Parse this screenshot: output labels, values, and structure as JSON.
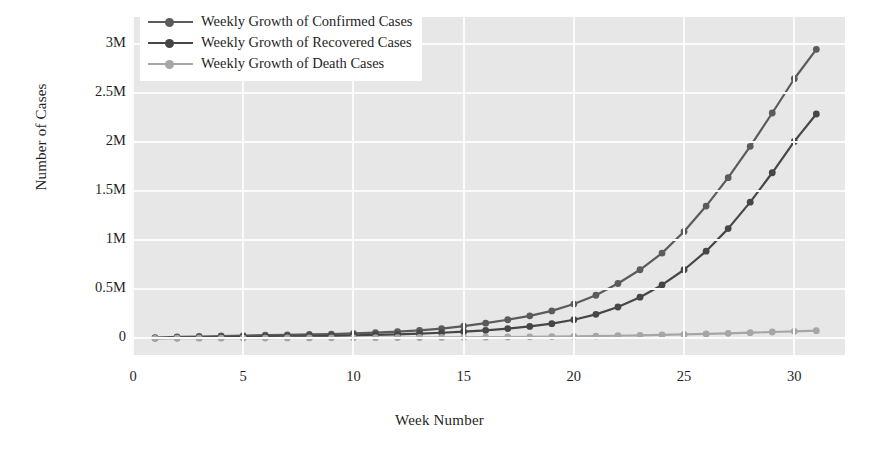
{
  "chart_data": {
    "type": "line",
    "title": "",
    "xlabel": "Week Number",
    "ylabel": "Number of Cases",
    "xlim": [
      0,
      32.3
    ],
    "ylim": [
      -170000,
      3280000
    ],
    "grid": true,
    "legend_position": "top-left",
    "x": [
      1,
      2,
      3,
      4,
      5,
      6,
      7,
      8,
      9,
      10,
      11,
      12,
      13,
      14,
      15,
      16,
      17,
      18,
      19,
      20,
      21,
      22,
      23,
      24,
      25,
      26,
      27,
      28,
      29,
      30,
      31
    ],
    "xticks": [
      0,
      5,
      10,
      15,
      20,
      25,
      30
    ],
    "xtick_labels": [
      "0",
      "5",
      "10",
      "15",
      "20",
      "25",
      "30"
    ],
    "yticks": [
      0,
      500000,
      1000000,
      1500000,
      2000000,
      2500000,
      3000000
    ],
    "ytick_labels": [
      "0",
      "0.5M",
      "1M",
      "1.5M",
      "2M",
      "2.5M",
      "3M"
    ],
    "series": [
      {
        "name": "Weekly Growth of Confirmed Cases",
        "color": "#5b5b5b",
        "marker": "circle",
        "values": [
          8000,
          14000,
          19000,
          24000,
          28000,
          32000,
          36000,
          40000,
          44000,
          50000,
          58000,
          68000,
          82000,
          100000,
          125000,
          155000,
          190000,
          230000,
          280000,
          350000,
          440000,
          560000,
          700000,
          870000,
          1090000,
          1350000,
          1640000,
          1960000,
          2300000,
          2650000,
          2950000
        ]
      },
      {
        "name": "Weekly Growth of Recovered Cases",
        "color": "#464646",
        "marker": "circle",
        "values": [
          3000,
          5000,
          8000,
          11000,
          14000,
          17000,
          20000,
          23000,
          26000,
          30000,
          35000,
          41000,
          48000,
          57000,
          68000,
          82000,
          100000,
          122000,
          150000,
          190000,
          245000,
          320000,
          420000,
          545000,
          700000,
          890000,
          1120000,
          1390000,
          1690000,
          2010000,
          2290000
        ]
      },
      {
        "name": "Weekly Growth of Death Cases",
        "color": "#a6a6a6",
        "marker": "circle",
        "values": [
          500,
          900,
          1400,
          2000,
          2600,
          3200,
          3800,
          4400,
          5000,
          5700,
          6500,
          7400,
          8400,
          9500,
          10800,
          12200,
          13800,
          15600,
          17600,
          20000,
          23000,
          26500,
          30500,
          35000,
          40000,
          45500,
          51500,
          58000,
          65000,
          72000,
          78000
        ]
      }
    ]
  },
  "legend": {
    "items": [
      {
        "label": "Weekly Growth of Confirmed Cases",
        "color": "#5b5b5b"
      },
      {
        "label": "Weekly Growth of Recovered Cases",
        "color": "#464646"
      },
      {
        "label": "Weekly Growth of Death Cases",
        "color": "#a6a6a6"
      }
    ]
  },
  "axes": {
    "x_title": "Week Number",
    "y_title": "Number of Cases"
  },
  "style": {
    "plot_background": "#e7e7e7",
    "grid_color": "#fbfbfb",
    "figure_background": "#ffffff",
    "text_color": "#1f1f1f"
  }
}
